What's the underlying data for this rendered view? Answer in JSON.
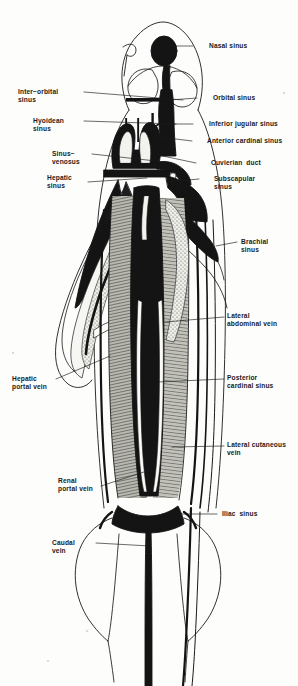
{
  "figure": {
    "specimen": "dogfish",
    "view": "ventral",
    "style": "line-and-stipple anatomical plate",
    "ink_color": "#1a1a1a",
    "background_color": "#fdfdfc",
    "muscle_tone_color": "#8d8d87",
    "vein_fill_color": "#141414"
  },
  "labels": [
    {
      "id": "nasal-sinus",
      "text": "Nasal sinus",
      "side": "right",
      "x": 209,
      "y": 42,
      "leader": [
        [
          193,
          46
        ],
        [
          175,
          46
        ]
      ]
    },
    {
      "id": "orbital-sinus",
      "text": "Orbital sinus",
      "side": "right",
      "x": 213,
      "y": 94,
      "leader": [
        [
          197,
          98
        ],
        [
          170,
          100
        ]
      ]
    },
    {
      "id": "inferior-jugular-sinus",
      "text": "Inferior jugular sinus",
      "side": "right",
      "x": 209,
      "y": 120,
      "leader": [
        [
          193,
          124
        ],
        [
          163,
          124
        ]
      ]
    },
    {
      "id": "anterior-cardinal-sinus",
      "text": "Anterior cardinal sinus",
      "side": "right",
      "x": 207,
      "y": 137,
      "leader": [
        [
          192,
          141
        ],
        [
          160,
          137
        ]
      ]
    },
    {
      "id": "cuvierian-duct",
      "text": "Cuvierian  duct",
      "side": "right",
      "x": 211,
      "y": 159,
      "leader": [
        [
          196,
          163
        ],
        [
          158,
          155
        ]
      ]
    },
    {
      "id": "subscapular-sinus",
      "text": "Subscapular\nsinus",
      "side": "right",
      "x": 214,
      "y": 175,
      "leader": [
        [
          199,
          179
        ],
        [
          168,
          182
        ]
      ]
    },
    {
      "id": "brachial-sinus",
      "text": "Brachial\nsinus",
      "side": "right",
      "x": 241,
      "y": 238,
      "leader": [
        [
          237,
          242
        ],
        [
          216,
          246
        ]
      ]
    },
    {
      "id": "lateral-abdominal-vein",
      "text": "Lateral\nabdominal vein",
      "side": "right",
      "x": 227,
      "y": 312,
      "leader": [
        [
          224,
          317
        ],
        [
          165,
          322
        ]
      ]
    },
    {
      "id": "posterior-cardinal-sinus",
      "text": "Posterior\ncardinal sinus",
      "side": "right",
      "x": 227,
      "y": 374,
      "leader": [
        [
          224,
          379
        ],
        [
          158,
          382
        ]
      ]
    },
    {
      "id": "lateral-cutaneous-vein",
      "text": "Lateral cutaneous\nvein",
      "side": "right",
      "x": 227,
      "y": 441,
      "leader": [
        [
          224,
          446
        ],
        [
          172,
          447
        ]
      ]
    },
    {
      "id": "iliac-sinus",
      "text": "Iliac  sinus",
      "side": "right",
      "x": 222,
      "y": 510,
      "leader": [
        [
          217,
          514
        ],
        [
          163,
          514
        ]
      ]
    },
    {
      "id": "inter-orbital-sinus",
      "text": "Inter−orbital\nsinus",
      "side": "left",
      "x": 18,
      "y": 88,
      "leader": [
        [
          84,
          92
        ],
        [
          183,
          100
        ]
      ]
    },
    {
      "id": "hyoidean-sinus",
      "text": "Hyoidean\nsinus",
      "side": "left",
      "x": 33,
      "y": 117,
      "leader": [
        [
          84,
          121
        ],
        [
          176,
          124
        ]
      ]
    },
    {
      "id": "sinus-venosus",
      "text": "Sinus−\nvenosus",
      "side": "left",
      "x": 52,
      "y": 150,
      "leader": [
        [
          92,
          154
        ],
        [
          165,
          162
        ]
      ]
    },
    {
      "id": "hepatic-sinus",
      "text": "Hepatic\nsinus",
      "side": "left",
      "x": 47,
      "y": 174,
      "leader": [
        [
          88,
          182
        ],
        [
          147,
          178
        ]
      ]
    },
    {
      "id": "hepatic-portal-vein",
      "text": "Hepatic\nportal vein",
      "side": "left",
      "x": 12,
      "y": 375,
      "leader": [
        [
          56,
          379
        ],
        [
          110,
          356
        ]
      ]
    },
    {
      "id": "renal-portal-vein",
      "text": "Renal\nportal vein",
      "side": "left",
      "x": 58,
      "y": 477,
      "leader": [
        [
          101,
          486
        ],
        [
          150,
          470
        ]
      ]
    },
    {
      "id": "caudal-vein",
      "text": "Caudal\nvein",
      "side": "left",
      "x": 52,
      "y": 539,
      "leader": [
        [
          96,
          543
        ],
        [
          150,
          546
        ]
      ]
    }
  ],
  "structures": [
    {
      "id": "body-outline",
      "name": "body outline",
      "kind": "contour"
    },
    {
      "id": "head-outline",
      "name": "head / snout outline",
      "kind": "contour"
    },
    {
      "id": "nasal-sinus-blob",
      "name": "nasal sinus",
      "kind": "filled-vein"
    },
    {
      "id": "orbital-ring",
      "name": "orbital sinus ring",
      "kind": "contour"
    },
    {
      "id": "interorbital-bar",
      "name": "inter-orbital sinus bar",
      "kind": "filled-vein"
    },
    {
      "id": "hyoidean-bars",
      "name": "hyoidean sinus bars",
      "kind": "filled-vein"
    },
    {
      "id": "anterior-cardinal",
      "name": "anterior cardinal sinus",
      "kind": "filled-vein"
    },
    {
      "id": "sinus-venosus-horns",
      "name": "sinus venosus",
      "kind": "filled-vein"
    },
    {
      "id": "cuvierian-ducts",
      "name": "Cuvierian ducts",
      "kind": "filled-vein"
    },
    {
      "id": "brachial-wing",
      "name": "brachial sinus",
      "kind": "filled-vein"
    },
    {
      "id": "pectoral-fin-left",
      "name": "left pectoral fin",
      "kind": "contour"
    },
    {
      "id": "liver-lobe",
      "name": "liver / hepatic region",
      "kind": "stippled"
    },
    {
      "id": "trunk-muscle",
      "name": "trunk musculature",
      "kind": "hatched"
    },
    {
      "id": "post-cardinal",
      "name": "posterior cardinal sinus",
      "kind": "filled-vein"
    },
    {
      "id": "lateral-abdominal",
      "name": "lateral abdominal vein",
      "kind": "line-vein"
    },
    {
      "id": "lateral-cutaneous",
      "name": "lateral cutaneous vein",
      "kind": "line-vein"
    },
    {
      "id": "iliac",
      "name": "iliac sinus",
      "kind": "filled-vein"
    },
    {
      "id": "caudal",
      "name": "caudal vein",
      "kind": "filled-vein"
    },
    {
      "id": "pelvic-fins",
      "name": "pelvic fins",
      "kind": "contour"
    },
    {
      "id": "tail",
      "name": "tail region",
      "kind": "contour"
    }
  ]
}
